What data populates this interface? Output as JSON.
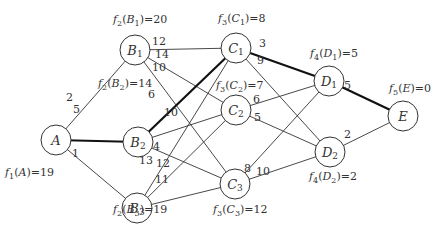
{
  "diagram": {
    "type": "multistage-shortest-path-graph",
    "nodes": [
      {
        "id": "A",
        "label": "A",
        "sub": "",
        "x": 56,
        "y": 140,
        "f": "f1(A)=19",
        "f_fn": "f",
        "f_stage": "1",
        "f_arg": "A",
        "f_sub": "",
        "f_val": "=19",
        "fx": 5,
        "fy": 176
      },
      {
        "id": "B1",
        "label": "B",
        "sub": "1",
        "x": 135,
        "y": 50,
        "f": "f2(B1)=20",
        "f_fn": "f",
        "f_stage": "2",
        "f_arg": "B",
        "f_sub": "1",
        "f_val": "=20",
        "fx": 113,
        "fy": 23
      },
      {
        "id": "B2",
        "label": "B",
        "sub": "2",
        "x": 138,
        "y": 142,
        "f": "f2(B2)=14",
        "f_fn": "f",
        "f_stage": "2",
        "f_arg": "B",
        "f_sub": "2",
        "f_val": "=14",
        "fx": 98,
        "fy": 87
      },
      {
        "id": "B3",
        "label": "B",
        "sub": "3",
        "x": 137,
        "y": 208,
        "f": "f2(B3)=19",
        "f_fn": "f",
        "f_stage": "2",
        "f_arg": "B",
        "f_sub": "3",
        "f_val": "=19",
        "fx": 113,
        "fy": 213
      },
      {
        "id": "C1",
        "label": "C",
        "sub": "1",
        "x": 236,
        "y": 48,
        "f": "f3(C1)=8",
        "f_fn": "f",
        "f_stage": "3",
        "f_arg": "C",
        "f_sub": "1",
        "f_val": "=8",
        "fx": 218,
        "fy": 22
      },
      {
        "id": "C2",
        "label": "C",
        "sub": "2",
        "x": 236,
        "y": 110,
        "f": "f3(C2)=7",
        "f_fn": "f",
        "f_stage": "3",
        "f_arg": "C",
        "f_sub": "2",
        "f_val": "=7",
        "fx": 216,
        "fy": 89
      },
      {
        "id": "C3",
        "label": "C",
        "sub": "3",
        "x": 235,
        "y": 184,
        "f": "f3(C3)=12",
        "f_fn": "f",
        "f_stage": "3",
        "f_arg": "C",
        "f_sub": "3",
        "f_val": "=12",
        "fx": 213,
        "fy": 213
      },
      {
        "id": "D1",
        "label": "D",
        "sub": "1",
        "x": 329,
        "y": 81,
        "f": "f4(D1)=5",
        "f_fn": "f",
        "f_stage": "4",
        "f_arg": "D",
        "f_sub": "1",
        "f_val": "=5",
        "fx": 310,
        "fy": 57
      },
      {
        "id": "D2",
        "label": "D",
        "sub": "2",
        "x": 330,
        "y": 152,
        "f": "f4(D2)=2",
        "f_fn": "f",
        "f_stage": "4",
        "f_arg": "D",
        "f_sub": "2",
        "f_val": "=2",
        "fx": 309,
        "fy": 180
      },
      {
        "id": "E",
        "label": "E",
        "sub": "",
        "x": 403,
        "y": 116,
        "f": "f5(E)=0",
        "f_fn": "f",
        "f_stage": "5",
        "f_arg": "E",
        "f_sub": "",
        "f_val": "=0",
        "fx": 389,
        "fy": 92
      }
    ],
    "edges": [
      {
        "from": "A",
        "to": "B1",
        "weight": "2",
        "bold": false,
        "lx": 66,
        "ly": 101
      },
      {
        "from": "A",
        "to": "B2",
        "weight": "5",
        "bold": true,
        "lx": 73,
        "ly": 113
      },
      {
        "from": "A",
        "to": "B3",
        "weight": "1",
        "bold": false,
        "lx": 72,
        "ly": 157
      },
      {
        "from": "B1",
        "to": "C1",
        "weight": "12",
        "bold": false,
        "lx": 152,
        "ly": 45
      },
      {
        "from": "B1",
        "to": "C2",
        "weight": "14",
        "bold": false,
        "lx": 155,
        "ly": 58
      },
      {
        "from": "B1",
        "to": "C3",
        "weight": "10",
        "bold": false,
        "lx": 152,
        "ly": 71
      },
      {
        "from": "B2",
        "to": "C1",
        "weight": "6",
        "bold": true,
        "lx": 148,
        "ly": 98
      },
      {
        "from": "B2",
        "to": "C2",
        "weight": "10",
        "bold": false,
        "lx": 164,
        "ly": 116
      },
      {
        "from": "B2",
        "to": "C3",
        "weight": "4",
        "bold": false,
        "lx": 153,
        "ly": 150
      },
      {
        "from": "B3",
        "to": "C1",
        "weight": "13",
        "bold": false,
        "lx": 139,
        "ly": 164
      },
      {
        "from": "B3",
        "to": "C2",
        "weight": "12",
        "bold": false,
        "lx": 156,
        "ly": 167
      },
      {
        "from": "B3",
        "to": "C3",
        "weight": "11",
        "bold": false,
        "lx": 155,
        "ly": 183
      },
      {
        "from": "C1",
        "to": "D1",
        "weight": "3",
        "bold": true,
        "lx": 259,
        "ly": 47
      },
      {
        "from": "C1",
        "to": "D2",
        "weight": "9",
        "bold": false,
        "lx": 257,
        "ly": 64
      },
      {
        "from": "C2",
        "to": "D1",
        "weight": "6",
        "bold": false,
        "lx": 253,
        "ly": 103
      },
      {
        "from": "C2",
        "to": "D2",
        "weight": "5",
        "bold": false,
        "lx": 254,
        "ly": 121
      },
      {
        "from": "C3",
        "to": "D1",
        "weight": "8",
        "bold": false,
        "lx": 244,
        "ly": 172
      },
      {
        "from": "C3",
        "to": "D2",
        "weight": "10",
        "bold": false,
        "lx": 256,
        "ly": 175
      },
      {
        "from": "D1",
        "to": "E",
        "weight": "5",
        "bold": true,
        "lx": 344,
        "ly": 89
      },
      {
        "from": "D2",
        "to": "E",
        "weight": "2",
        "bold": false,
        "lx": 344,
        "ly": 138
      }
    ],
    "node_radius": 15,
    "colors": {
      "stroke": "#333333",
      "bold_stroke": "#111111",
      "background": "#ffffff",
      "text": "#333333"
    }
  }
}
